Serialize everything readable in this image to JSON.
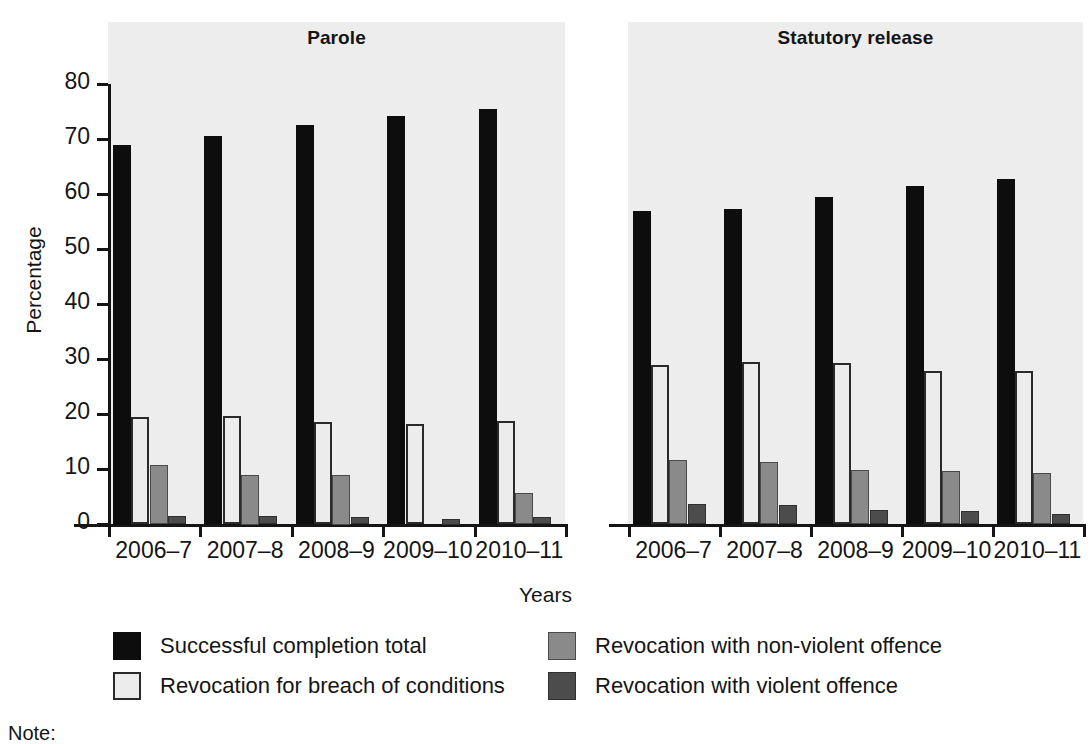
{
  "chart_data": {
    "type": "bar",
    "title": "",
    "xlabel": "Years",
    "ylabel": "Percentage",
    "ylim": [
      0,
      80
    ],
    "yticks": [
      0,
      10,
      20,
      30,
      40,
      50,
      60,
      70,
      80
    ],
    "grid": false,
    "legend_position": "bottom",
    "panels": [
      {
        "name": "Parole",
        "categories": [
          "2006–7",
          "2007–8",
          "2008–9",
          "2009–10",
          "2010–11"
        ],
        "series": [
          {
            "name": "Successful completion total",
            "color": "#0d0d0d",
            "values": [
              69.0,
              70.6,
              72.6,
              74.1,
              75.4
            ]
          },
          {
            "name": "Revocation for breach of conditions",
            "color": "#ececed",
            "values": [
              19.5,
              19.6,
              18.6,
              18.2,
              18.7
            ]
          },
          {
            "name": "Revocation with non-violent offence",
            "color": "#8a8a8a",
            "values": [
              10.8,
              9.0,
              9.0,
              0.0,
              5.6
            ]
          },
          {
            "name": "Revocation with violent offence",
            "color": "#4c4c4c",
            "values": [
              1.5,
              1.5,
              1.3,
              1.0,
              1.3
            ]
          }
        ]
      },
      {
        "name": "Statutory release",
        "categories": [
          "2006–7",
          "2007–8",
          "2008–9",
          "2009–10",
          "2010–11"
        ],
        "series": [
          {
            "name": "Successful completion total",
            "color": "#0d0d0d",
            "values": [
              57.0,
              57.2,
              59.5,
              61.4,
              62.7
            ]
          },
          {
            "name": "Revocation for breach of conditions",
            "color": "#ececed",
            "values": [
              28.9,
              29.4,
              29.3,
              27.9,
              27.9
            ]
          },
          {
            "name": "Revocation with non-violent offence",
            "color": "#8a8a8a",
            "values": [
              11.7,
              11.2,
              9.9,
              9.6,
              9.2
            ]
          },
          {
            "name": "Revocation with violent offence",
            "color": "#4c4c4c",
            "values": [
              3.6,
              3.4,
              2.5,
              2.4,
              1.8
            ]
          }
        ]
      }
    ]
  },
  "axes": {
    "y_title": "Percentage",
    "x_title": "Years",
    "y_tick_labels": [
      "80",
      "70",
      "60",
      "50",
      "40",
      "30",
      "20",
      "10",
      "0"
    ],
    "x_tick_labels": [
      "2006–7",
      "2007–8",
      "2008–9",
      "2009–10",
      "2010–11"
    ]
  },
  "panel_titles": {
    "left": "Parole",
    "right": "Statutory release"
  },
  "legend": {
    "items": [
      {
        "label": "Successful completion total",
        "swatch": "black-square-icon"
      },
      {
        "label": "Revocation for breach of conditions",
        "swatch": "white-square-icon"
      },
      {
        "label": "Revocation with non-violent offence",
        "swatch": "light-gray-square-icon"
      },
      {
        "label": "Revocation with violent offence",
        "swatch": "dark-gray-square-icon"
      }
    ]
  },
  "footnote": {
    "label": "Note:"
  },
  "colors": {
    "panel_background": "#ededee",
    "page_background": "#ffffff",
    "axis": "#151515",
    "series_successful": "#0d0d0d",
    "series_breach": "#ececed",
    "series_nonviolent": "#8a8a8a",
    "series_violent": "#4c4c4c"
  }
}
